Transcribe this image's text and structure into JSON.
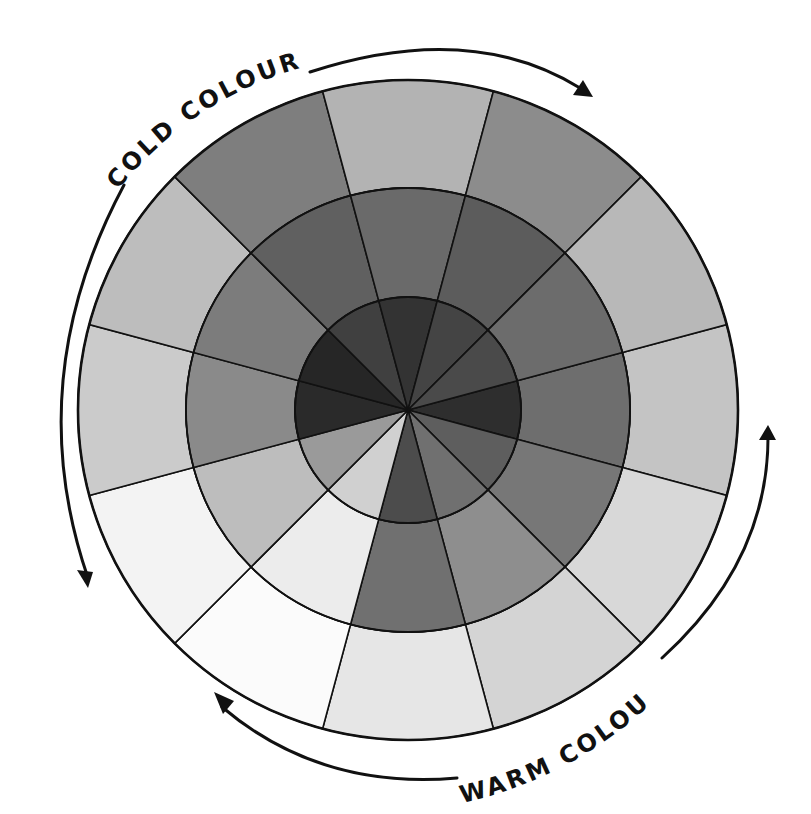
{
  "diagram": {
    "type": "colour-wheel-grayscale",
    "center": [
      408,
      410
    ],
    "radii": {
      "outer": 330,
      "middle": 222,
      "inner": 113
    },
    "segment_count": 12,
    "start_angle_deg": -15,
    "segments": [
      {
        "index": 0,
        "outer": "#c4c4c4",
        "middle": "#6e6e6e",
        "inner": "#2e2e2e"
      },
      {
        "index": 1,
        "outer": "#d8d8d8",
        "middle": "#777777",
        "inner": "#5e5e5e"
      },
      {
        "index": 2,
        "outer": "#d4d4d4",
        "middle": "#8e8e8e",
        "inner": "#707070"
      },
      {
        "index": 3,
        "outer": "#e6e6e6",
        "middle": "#707070",
        "inner": "#4c4c4c"
      },
      {
        "index": 4,
        "outer": "#fbfbfb",
        "middle": "#ececec",
        "inner": "#d0d0d0"
      },
      {
        "index": 5,
        "outer": "#f3f3f3",
        "middle": "#bdbdbd",
        "inner": "#9a9a9a"
      },
      {
        "index": 6,
        "outer": "#cbcbcb",
        "middle": "#8a8a8a",
        "inner": "#2a2a2a"
      },
      {
        "index": 7,
        "outer": "#bdbdbd",
        "middle": "#7c7c7c",
        "inner": "#262626"
      },
      {
        "index": 8,
        "outer": "#7e7e7e",
        "middle": "#606060",
        "inner": "#404040"
      },
      {
        "index": 9,
        "outer": "#b3b3b3",
        "middle": "#6a6a6a",
        "inner": "#333333"
      },
      {
        "index": 10,
        "outer": "#8c8c8c",
        "middle": "#5c5c5c",
        "inner": "#444444"
      },
      {
        "index": 11,
        "outer": "#b8b8b8",
        "middle": "#6c6c6c",
        "inner": "#4a4a4a"
      }
    ],
    "labels": {
      "cold": "COLD COLOURS",
      "warm": "WARM COLOURS"
    },
    "arrows": [
      {
        "name": "cold-clockwise-arrow",
        "direction": "clockwise-top-right"
      },
      {
        "name": "cold-counterclockwise-arrow",
        "direction": "down-left"
      },
      {
        "name": "warm-up-arrow",
        "direction": "up-right"
      },
      {
        "name": "warm-left-arrow",
        "direction": "left-bottom"
      }
    ],
    "stroke_color": "#111111"
  }
}
